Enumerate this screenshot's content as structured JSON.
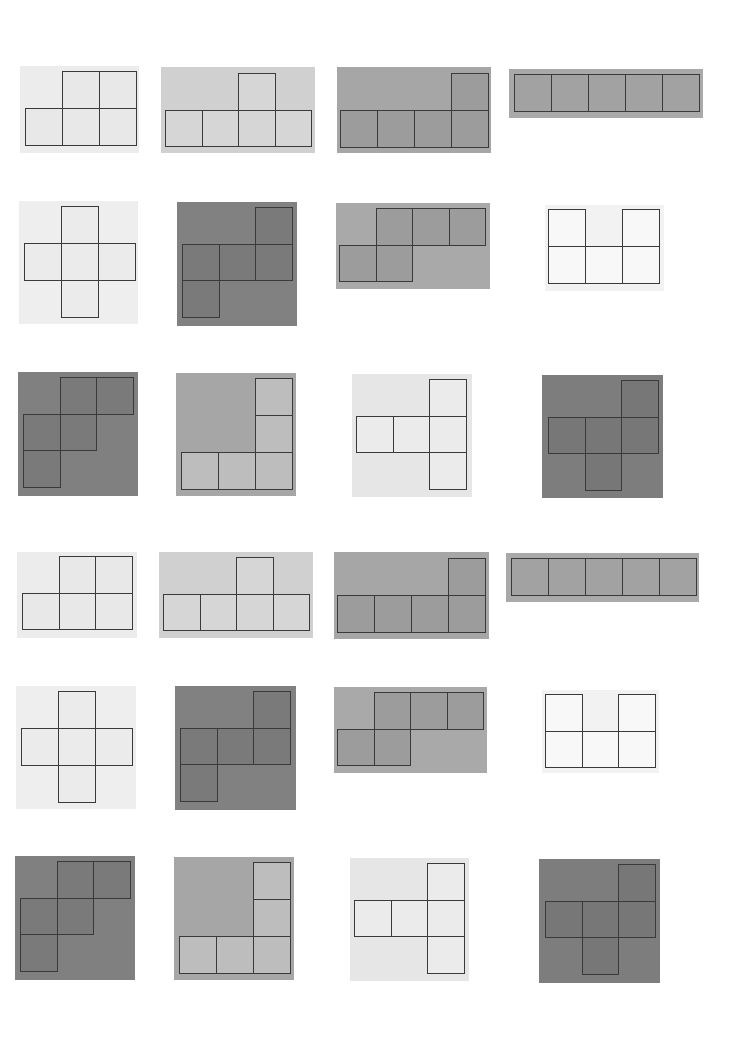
{
  "palette": {
    "very_light": "#f0f0f0",
    "light": "#d2d2d2",
    "medium": "#a3a3a3",
    "dark": "#7b7b7b",
    "cell_light_white": "#f7f7f7",
    "line": "#3a3a3a"
  },
  "cards": [
    {
      "id": "r1c1",
      "x": 20,
      "y": 66,
      "w": 119,
      "h": 87,
      "bg": "#ececec",
      "cellbg": "#e8e8e8",
      "s": 37,
      "ox": 5,
      "oy": 5,
      "cells": [
        [
          1,
          0
        ],
        [
          2,
          0
        ],
        [
          0,
          1
        ],
        [
          1,
          1
        ],
        [
          2,
          1
        ]
      ]
    },
    {
      "id": "r1c2",
      "x": 161,
      "y": 67,
      "w": 154,
      "h": 86,
      "bg": "#d0d0d0",
      "cellbg": "#d6d6d6",
      "s": 36.5,
      "ox": 4,
      "oy": 6,
      "cells": [
        [
          2,
          0
        ],
        [
          0,
          1
        ],
        [
          1,
          1
        ],
        [
          2,
          1
        ],
        [
          3,
          1
        ]
      ]
    },
    {
      "id": "r1c3",
      "x": 337,
      "y": 67,
      "w": 154,
      "h": 86,
      "bg": "#a6a6a6",
      "cellbg": "#9c9c9c",
      "s": 37,
      "ox": 3,
      "oy": 6,
      "cells": [
        [
          3,
          0
        ],
        [
          0,
          1
        ],
        [
          1,
          1
        ],
        [
          2,
          1
        ],
        [
          3,
          1
        ]
      ]
    },
    {
      "id": "r1c4",
      "x": 509,
      "y": 69,
      "w": 194,
      "h": 49,
      "bg": "#a9a9a9",
      "cellbg": "#a2a2a2",
      "s": 37,
      "ox": 5,
      "oy": 5,
      "cells": [
        [
          0,
          0
        ],
        [
          1,
          0
        ],
        [
          2,
          0
        ],
        [
          3,
          0
        ],
        [
          4,
          0
        ]
      ]
    },
    {
      "id": "r2c1",
      "x": 19,
      "y": 201,
      "w": 119,
      "h": 123,
      "bg": "#eeeeee",
      "cellbg": "#ebebeb",
      "s": 37,
      "ox": 5,
      "oy": 5,
      "cells": [
        [
          1,
          0
        ],
        [
          0,
          1
        ],
        [
          1,
          1
        ],
        [
          2,
          1
        ],
        [
          1,
          2
        ]
      ]
    },
    {
      "id": "r2c2",
      "x": 177,
      "y": 202,
      "w": 120,
      "h": 124,
      "bg": "#818181",
      "cellbg": "#7a7a7a",
      "s": 36.5,
      "ox": 5,
      "oy": 5,
      "cells": [
        [
          2,
          0
        ],
        [
          0,
          1
        ],
        [
          1,
          1
        ],
        [
          2,
          1
        ],
        [
          0,
          2
        ]
      ]
    },
    {
      "id": "r2c3",
      "x": 336,
      "y": 203,
      "w": 154,
      "h": 86,
      "bg": "#a9a9a9",
      "cellbg": "#9c9c9c",
      "s": 36.5,
      "ox": 3,
      "oy": 5,
      "cells": [
        [
          1,
          0
        ],
        [
          2,
          0
        ],
        [
          3,
          0
        ],
        [
          0,
          1
        ],
        [
          1,
          1
        ]
      ]
    },
    {
      "id": "r2c4",
      "x": 545,
      "y": 205,
      "w": 119,
      "h": 86,
      "bg": "#f2f2f2",
      "cellbg": "#f8f8f8",
      "s": 37,
      "ox": 3,
      "oy": 4,
      "cells": [
        [
          0,
          0
        ],
        [
          2,
          0
        ],
        [
          0,
          1
        ],
        [
          1,
          1
        ],
        [
          2,
          1
        ]
      ]
    },
    {
      "id": "r3c1",
      "x": 18,
      "y": 372,
      "w": 120,
      "h": 124,
      "bg": "#808080",
      "cellbg": "#7a7a7a",
      "s": 36.5,
      "ox": 5,
      "oy": 5,
      "cells": [
        [
          1,
          0
        ],
        [
          2,
          0
        ],
        [
          0,
          1
        ],
        [
          1,
          1
        ],
        [
          0,
          2
        ]
      ]
    },
    {
      "id": "r3c2",
      "x": 176,
      "y": 373,
      "w": 120,
      "h": 123,
      "bg": "#a6a6a6",
      "cellbg": "#bdbdbd",
      "s": 37,
      "ox": 5,
      "oy": 5,
      "cells": [
        [
          2,
          0
        ],
        [
          2,
          1
        ],
        [
          0,
          2
        ],
        [
          1,
          2
        ],
        [
          2,
          2
        ]
      ]
    },
    {
      "id": "r3c3",
      "x": 352,
      "y": 374,
      "w": 120,
      "h": 123,
      "bg": "#e6e6e6",
      "cellbg": "#ebebeb",
      "s": 36.5,
      "ox": 4,
      "oy": 5,
      "cells": [
        [
          2,
          0
        ],
        [
          0,
          1
        ],
        [
          1,
          1
        ],
        [
          2,
          1
        ],
        [
          2,
          2
        ]
      ]
    },
    {
      "id": "r3c4",
      "x": 542,
      "y": 375,
      "w": 121,
      "h": 123,
      "bg": "#7d7d7d",
      "cellbg": "#777777",
      "s": 36.5,
      "ox": 6,
      "oy": 5,
      "cells": [
        [
          2,
          0
        ],
        [
          0,
          1
        ],
        [
          1,
          1
        ],
        [
          2,
          1
        ],
        [
          1,
          2
        ]
      ]
    },
    {
      "id": "r4c1",
      "x": 17,
      "y": 552,
      "w": 120,
      "h": 86,
      "bg": "#ececec",
      "cellbg": "#e8e8e8",
      "s": 36.5,
      "ox": 5,
      "oy": 4,
      "cells": [
        [
          1,
          0
        ],
        [
          2,
          0
        ],
        [
          0,
          1
        ],
        [
          1,
          1
        ],
        [
          2,
          1
        ]
      ]
    },
    {
      "id": "r4c2",
      "x": 159,
      "y": 552,
      "w": 154,
      "h": 86,
      "bg": "#d0d0d0",
      "cellbg": "#d6d6d6",
      "s": 36.5,
      "ox": 4,
      "oy": 5,
      "cells": [
        [
          2,
          0
        ],
        [
          0,
          1
        ],
        [
          1,
          1
        ],
        [
          2,
          1
        ],
        [
          3,
          1
        ]
      ]
    },
    {
      "id": "r4c3",
      "x": 334,
      "y": 552,
      "w": 155,
      "h": 87,
      "bg": "#a6a6a6",
      "cellbg": "#9c9c9c",
      "s": 37,
      "ox": 3,
      "oy": 6,
      "cells": [
        [
          3,
          0
        ],
        [
          0,
          1
        ],
        [
          1,
          1
        ],
        [
          2,
          1
        ],
        [
          3,
          1
        ]
      ]
    },
    {
      "id": "r4c4",
      "x": 506,
      "y": 553,
      "w": 193,
      "h": 49,
      "bg": "#a9a9a9",
      "cellbg": "#a2a2a2",
      "s": 37,
      "ox": 5,
      "oy": 5,
      "cells": [
        [
          0,
          0
        ],
        [
          1,
          0
        ],
        [
          2,
          0
        ],
        [
          3,
          0
        ],
        [
          4,
          0
        ]
      ]
    },
    {
      "id": "r5c1",
      "x": 16,
      "y": 686,
      "w": 120,
      "h": 123,
      "bg": "#eeeeee",
      "cellbg": "#ebebeb",
      "s": 37,
      "ox": 5,
      "oy": 5,
      "cells": [
        [
          1,
          0
        ],
        [
          0,
          1
        ],
        [
          1,
          1
        ],
        [
          2,
          1
        ],
        [
          1,
          2
        ]
      ]
    },
    {
      "id": "r5c2",
      "x": 175,
      "y": 686,
      "w": 121,
      "h": 124,
      "bg": "#818181",
      "cellbg": "#7a7a7a",
      "s": 36.5,
      "ox": 5,
      "oy": 5,
      "cells": [
        [
          2,
          0
        ],
        [
          0,
          1
        ],
        [
          1,
          1
        ],
        [
          2,
          1
        ],
        [
          0,
          2
        ]
      ]
    },
    {
      "id": "r5c3",
      "x": 334,
      "y": 687,
      "w": 153,
      "h": 86,
      "bg": "#a9a9a9",
      "cellbg": "#9c9c9c",
      "s": 36.5,
      "ox": 3,
      "oy": 5,
      "cells": [
        [
          1,
          0
        ],
        [
          2,
          0
        ],
        [
          3,
          0
        ],
        [
          0,
          1
        ],
        [
          1,
          1
        ]
      ]
    },
    {
      "id": "r5c4",
      "x": 542,
      "y": 690,
      "w": 117,
      "h": 83,
      "bg": "#f2f2f2",
      "cellbg": "#f8f8f8",
      "s": 36.5,
      "ox": 3,
      "oy": 4,
      "cells": [
        [
          0,
          0
        ],
        [
          2,
          0
        ],
        [
          0,
          1
        ],
        [
          1,
          1
        ],
        [
          2,
          1
        ]
      ]
    },
    {
      "id": "r6c1",
      "x": 15,
      "y": 856,
      "w": 120,
      "h": 124,
      "bg": "#808080",
      "cellbg": "#7a7a7a",
      "s": 36.5,
      "ox": 5,
      "oy": 5,
      "cells": [
        [
          1,
          0
        ],
        [
          2,
          0
        ],
        [
          0,
          1
        ],
        [
          1,
          1
        ],
        [
          0,
          2
        ]
      ]
    },
    {
      "id": "r6c2",
      "x": 174,
      "y": 857,
      "w": 120,
      "h": 123,
      "bg": "#a6a6a6",
      "cellbg": "#bdbdbd",
      "s": 37,
      "ox": 5,
      "oy": 5,
      "cells": [
        [
          2,
          0
        ],
        [
          2,
          1
        ],
        [
          0,
          2
        ],
        [
          1,
          2
        ],
        [
          2,
          2
        ]
      ]
    },
    {
      "id": "r6c3",
      "x": 350,
      "y": 858,
      "w": 119,
      "h": 123,
      "bg": "#e6e6e6",
      "cellbg": "#ebebeb",
      "s": 36.5,
      "ox": 4,
      "oy": 5,
      "cells": [
        [
          2,
          0
        ],
        [
          0,
          1
        ],
        [
          1,
          1
        ],
        [
          2,
          1
        ],
        [
          2,
          2
        ]
      ]
    },
    {
      "id": "r6c4",
      "x": 539,
      "y": 859,
      "w": 121,
      "h": 124,
      "bg": "#7d7d7d",
      "cellbg": "#777777",
      "s": 36.5,
      "ox": 6,
      "oy": 5,
      "cells": [
        [
          2,
          0
        ],
        [
          0,
          1
        ],
        [
          1,
          1
        ],
        [
          2,
          1
        ],
        [
          1,
          2
        ]
      ]
    }
  ]
}
